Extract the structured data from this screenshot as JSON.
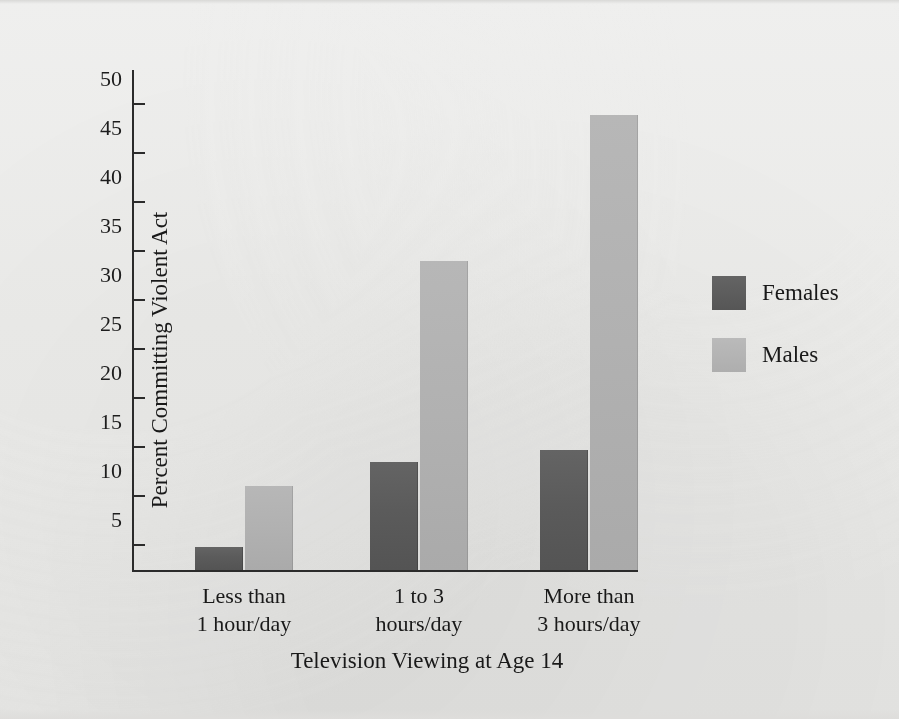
{
  "chart_data": {
    "type": "bar",
    "title": "",
    "xlabel": "Television Viewing at Age 14",
    "ylabel": "Percent Committing Violent Act",
    "categories": [
      "Less than 1 hour/day",
      "1 to 3 hours/day",
      "More than 3 hours/day"
    ],
    "category_lines": [
      [
        "Less than",
        "1 hour/day"
      ],
      [
        "1 to 3",
        "hours/day"
      ],
      [
        "More than",
        "3 hours/day"
      ]
    ],
    "series": [
      {
        "name": "Females",
        "color": "#5b5b5b",
        "values": [
          2.3,
          11.0,
          12.2
        ]
      },
      {
        "name": "Males",
        "color": "#b2b2b2",
        "values": [
          8.6,
          31.5,
          46.4
        ]
      }
    ],
    "ylim": [
      0,
      51
    ],
    "yticks": [
      5,
      10,
      15,
      20,
      25,
      30,
      35,
      40,
      45,
      50
    ],
    "ytick_labels": [
      "5",
      "10",
      "15",
      "20",
      "25",
      "30",
      "35",
      "40",
      "45",
      "50"
    ],
    "yminor_ticks": [
      2.5,
      7.5,
      12.5,
      17.5,
      22.5,
      27.5,
      32.5,
      37.5,
      42.5,
      47.5
    ],
    "grid": false,
    "legend_position": "right"
  },
  "legend": {
    "entries": [
      {
        "label": "Females"
      },
      {
        "label": "Males"
      }
    ]
  },
  "axes": {
    "y_title": "Percent Committing Violent Act",
    "x_title": "Television Viewing at Age 14"
  }
}
